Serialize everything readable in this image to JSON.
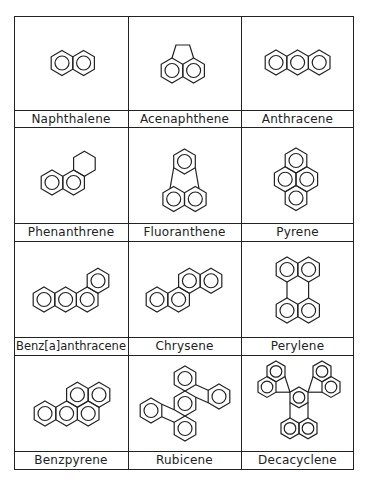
{
  "figure": {
    "type": "table-of-structures",
    "columns": 3,
    "rows": 4,
    "cells": [
      {
        "name": "Naphthalene",
        "rings": 2
      },
      {
        "name": "Acenaphthene",
        "rings": 3
      },
      {
        "name": "Anthracene",
        "rings": 3
      },
      {
        "name": "Phenanthrene",
        "rings": 3
      },
      {
        "name": "Fluoranthene",
        "rings": 4
      },
      {
        "name": "Pyrene",
        "rings": 4
      },
      {
        "name": "Benz[a]anthracene",
        "rings": 4
      },
      {
        "name": "Chrysene",
        "rings": 4
      },
      {
        "name": "Perylene",
        "rings": 5
      },
      {
        "name": "Benzpyrene",
        "rings": 5
      },
      {
        "name": "Rubicene",
        "rings": 5
      },
      {
        "name": "Decacyclene",
        "rings": 7
      }
    ]
  },
  "display_labels": {
    "c0": "Naphthalene",
    "c1": "Acenaphthene",
    "c2": "Anthracene",
    "c3": "Phenanthrene",
    "c4": "Fluoranthene",
    "c5": "Pyrene",
    "c6": "Benz[a]anthracene",
    "c7": "Chrysene",
    "c8": "Perylene",
    "c9": "Benzpyrene",
    "c10": "Rubicene",
    "c11": "Decacyclene"
  }
}
